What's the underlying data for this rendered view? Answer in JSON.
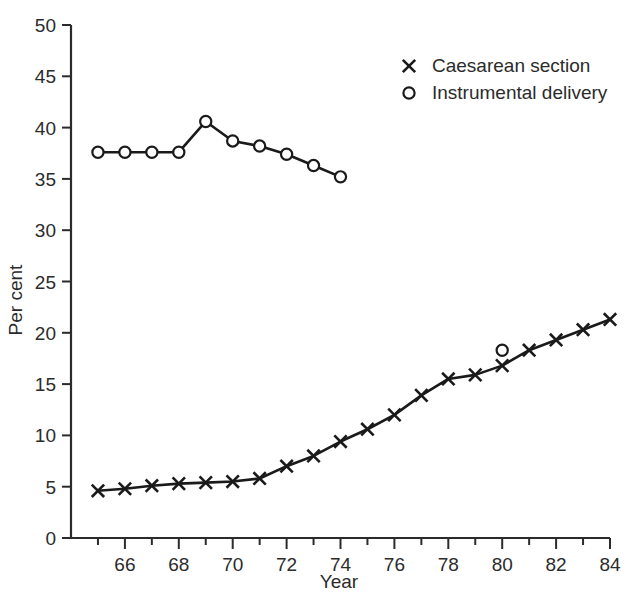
{
  "chart_data": {
    "type": "line",
    "title": "",
    "xlabel": "Year",
    "ylabel": "Per cent",
    "xlim": [
      65,
      84
    ],
    "ylim": [
      0,
      50
    ],
    "grid": false,
    "legend_position": "top-right",
    "y_ticks": [
      0,
      5,
      10,
      15,
      20,
      25,
      30,
      35,
      40,
      45,
      50
    ],
    "y_tick_labels": [
      "0",
      "5",
      "10",
      "15",
      "20",
      "25",
      "30",
      "35",
      "40",
      "45",
      "50"
    ],
    "x_ticks": [
      65,
      66,
      67,
      68,
      69,
      70,
      71,
      72,
      73,
      74,
      75,
      76,
      77,
      78,
      79,
      80,
      81,
      82,
      83,
      84
    ],
    "x_tick_labels": [
      "",
      "66",
      "",
      "68",
      "",
      "70",
      "",
      "72",
      "",
      "74",
      "",
      "76",
      "",
      "78",
      "",
      "80",
      "",
      "82",
      "",
      "84"
    ],
    "series": [
      {
        "name": "Caesarean section",
        "marker": "x",
        "x": [
          65,
          66,
          67,
          68,
          69,
          70,
          71,
          72,
          73,
          74,
          75,
          76,
          77,
          78,
          79,
          80,
          81,
          82,
          83,
          84
        ],
        "values": [
          4.6,
          4.8,
          5.1,
          5.3,
          5.4,
          5.5,
          5.8,
          7.0,
          8.0,
          9.4,
          10.6,
          12.0,
          13.9,
          15.5,
          15.9,
          16.8,
          18.3,
          19.3,
          20.3,
          21.3
        ]
      },
      {
        "name": "Instrumental delivery",
        "marker": "o",
        "x": [
          65,
          66,
          67,
          68,
          69,
          70,
          71,
          72,
          73,
          74
        ],
        "values": [
          37.6,
          37.6,
          37.6,
          37.6,
          40.6,
          38.7,
          38.2,
          37.4,
          36.3,
          35.2
        ]
      },
      {
        "name": "Instrumental delivery isolated point",
        "marker": "o",
        "connected": false,
        "x": [
          80
        ],
        "values": [
          18.3
        ]
      }
    ],
    "legend": [
      {
        "label": "Caesarean section",
        "marker": "x"
      },
      {
        "label": "Instrumental delivery",
        "marker": "o"
      }
    ],
    "colors": {
      "line": "#1a1a1a",
      "axis": "#2b2b2b",
      "background": "#ffffff"
    }
  }
}
